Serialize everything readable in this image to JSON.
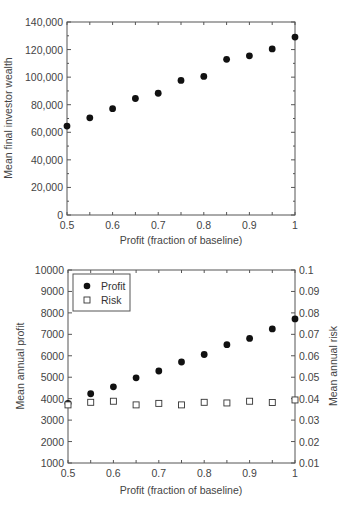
{
  "chart_data": [
    {
      "type": "scatter",
      "title": "",
      "xlabel": "Profit (fraction of baseline)",
      "ylabel": "Mean final investor wealth",
      "xlim": [
        0.5,
        1
      ],
      "ylim": [
        0,
        140000
      ],
      "xticks": [
        "0.5",
        "0.6",
        "0.7",
        "0.8",
        "0.9",
        "1"
      ],
      "yticks": [
        "0",
        "20,000",
        "40,000",
        "60,000",
        "80,000",
        "100,000",
        "120,000",
        "140,000"
      ],
      "grid": false,
      "x": [
        0.5,
        0.55,
        0.6,
        0.65,
        0.7,
        0.75,
        0.8,
        0.85,
        0.9,
        0.95,
        1.0
      ],
      "series": [
        {
          "name": "Mean final investor wealth",
          "marker": "filled-circle",
          "values": [
            64500,
            70500,
            77100,
            84500,
            88300,
            97600,
            100500,
            112900,
            115500,
            120500,
            129100
          ]
        }
      ]
    },
    {
      "type": "scatter",
      "title": "",
      "xlabel": "Profit (fraction of baseline)",
      "ylabel": "Mean annual profit",
      "ylabel_right": "Mean annual risk",
      "xlim": [
        0.5,
        1
      ],
      "ylim": [
        1000,
        10000
      ],
      "ylim_right": [
        0.01,
        0.1
      ],
      "xticks": [
        "0.5",
        "0.6",
        "0.7",
        "0.8",
        "0.9",
        "1"
      ],
      "yticks": [
        "1000",
        "2000",
        "3000",
        "4000",
        "5000",
        "6000",
        "7000",
        "8000",
        "9000",
        "10000"
      ],
      "yticks_right": [
        "0.01",
        "0.02",
        "0.03",
        "0.04",
        "0.05",
        "0.06",
        "0.07",
        "0.08",
        "0.09",
        "0.1"
      ],
      "grid": false,
      "legend_position": "upper-left",
      "legend": [
        "Profit",
        "Risk"
      ],
      "x": [
        0.5,
        0.55,
        0.6,
        0.65,
        0.7,
        0.75,
        0.8,
        0.85,
        0.9,
        0.95,
        1.0
      ],
      "series": [
        {
          "name": "Profit",
          "axis": "left",
          "marker": "filled-circle",
          "values": [
            3785,
            4230,
            4550,
            4970,
            5290,
            5710,
            6060,
            6520,
            6810,
            7250,
            7720
          ]
        },
        {
          "name": "Risk",
          "axis": "right",
          "marker": "open-square",
          "values": [
            0.0371,
            0.0383,
            0.0388,
            0.0371,
            0.0378,
            0.0371,
            0.0383,
            0.038,
            0.0388,
            0.0382,
            0.0394
          ]
        }
      ]
    }
  ]
}
